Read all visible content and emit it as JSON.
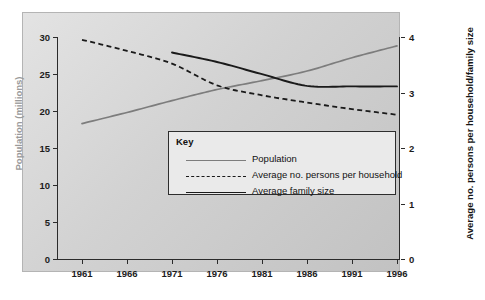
{
  "chart_data": {
    "type": "line",
    "title": "",
    "xlabel": "",
    "ylabel": "Population (millions)",
    "y2label": "Average no. persons per household/family size",
    "grid": false,
    "legend_position": "center",
    "legend_title": "Key",
    "x": [
      1961,
      1966,
      1971,
      1976,
      1981,
      1986,
      1991,
      1996
    ],
    "xtick_labels": [
      "1961",
      "1966",
      "1971",
      "1976",
      "1981",
      "1986",
      "1991",
      "1996"
    ],
    "xlim": [
      1959,
      1998
    ],
    "ylim": [
      0,
      30
    ],
    "ytick_labels": [
      "0",
      "5",
      "10",
      "15",
      "20",
      "25",
      "30"
    ],
    "ytick_values": [
      0,
      5,
      10,
      15,
      20,
      25,
      30
    ],
    "y2lim": [
      0,
      4
    ],
    "y2tick_labels": [
      "0",
      "1",
      "2",
      "3",
      "4"
    ],
    "y2tick_values": [
      0,
      1,
      2,
      3,
      4
    ],
    "series": [
      {
        "name": "Population",
        "axis": "left",
        "style": "solid",
        "color": "#7d7d7d",
        "x": [
          1961,
          1966,
          1971,
          1976,
          1981,
          1986,
          1991,
          1996
        ],
        "values": [
          18.3,
          19.8,
          21.4,
          22.9,
          24.1,
          25.4,
          27.2,
          28.8
        ]
      },
      {
        "name": "Average no. persons per household",
        "axis": "right",
        "style": "dashed",
        "color": "#1a1a1a",
        "x": [
          1961,
          1966,
          1971,
          1976,
          1981,
          1986,
          1991,
          1996
        ],
        "values": [
          3.95,
          3.75,
          3.52,
          3.13,
          2.95,
          2.82,
          2.7,
          2.6
        ]
      },
      {
        "name": "Average family size",
        "axis": "right",
        "style": "solid",
        "color": "#1a1a1a",
        "x": [
          1971,
          1976,
          1981,
          1986,
          1991,
          1996
        ],
        "values": [
          3.72,
          3.55,
          3.33,
          3.12,
          3.11,
          3.11
        ]
      }
    ]
  },
  "axes": {
    "left": {
      "title": "Population (millions)",
      "ticks": [
        "30",
        "25",
        "20",
        "15",
        "10",
        "5",
        "0"
      ]
    },
    "right": {
      "title": "Average no. persons per household/family size",
      "ticks": [
        "4",
        "3",
        "2",
        "1",
        "0"
      ]
    },
    "bottom": {
      "ticks": [
        "1961",
        "1966",
        "1971",
        "1976",
        "1981",
        "1986",
        "1991",
        "1996"
      ]
    }
  },
  "legend": {
    "title": "Key",
    "entries": [
      {
        "label": "Population",
        "swatch": "solid-grey-line-swatch"
      },
      {
        "label": "Average no. persons per household",
        "swatch": "dashed-black-line-swatch"
      },
      {
        "label": "Average family size",
        "swatch": "solid-black-line-swatch"
      }
    ]
  }
}
